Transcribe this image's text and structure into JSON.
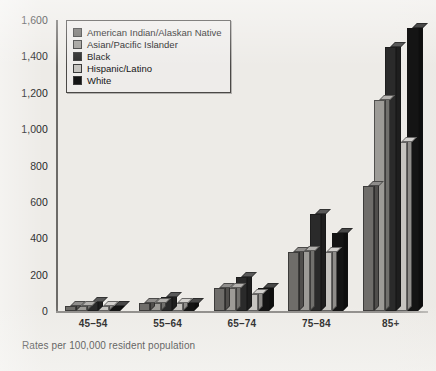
{
  "chart_data": {
    "type": "bar",
    "title": "",
    "subtitle": "",
    "xlabel": "",
    "ylabel": "",
    "caption": "Rates per 100,000 resident population",
    "categories": [
      "45–54",
      "55–64",
      "65–74",
      "75–84",
      "85+"
    ],
    "ylim": [
      0,
      1600
    ],
    "ytick_labels": [
      "0",
      "200",
      "400",
      "600",
      "800",
      "1,000",
      "1,200",
      "1,400",
      "1,600"
    ],
    "yticks": [
      0,
      200,
      400,
      600,
      800,
      1000,
      1200,
      1400,
      1600
    ],
    "grid": false,
    "legend_position": "top-left",
    "series": [
      {
        "name": "American Indian/Alaskan Native",
        "color": "#6f6d6a",
        "values": [
          28,
          44,
          127,
          325,
          690
        ]
      },
      {
        "name": "Asian/Pacific Islander",
        "color": "#9d9b97",
        "values": [
          28,
          44,
          127,
          330,
          1160
        ]
      },
      {
        "name": "Black",
        "color": "#2a2a2a",
        "values": [
          50,
          77,
          188,
          535,
          1450
        ]
      },
      {
        "name": "Hispanic/Latino",
        "color": "#c6c4c0",
        "values": [
          28,
          44,
          94,
          325,
          930
        ]
      },
      {
        "name": "White",
        "color": "#141414",
        "values": [
          28,
          44,
          127,
          430,
          1555
        ]
      }
    ]
  }
}
